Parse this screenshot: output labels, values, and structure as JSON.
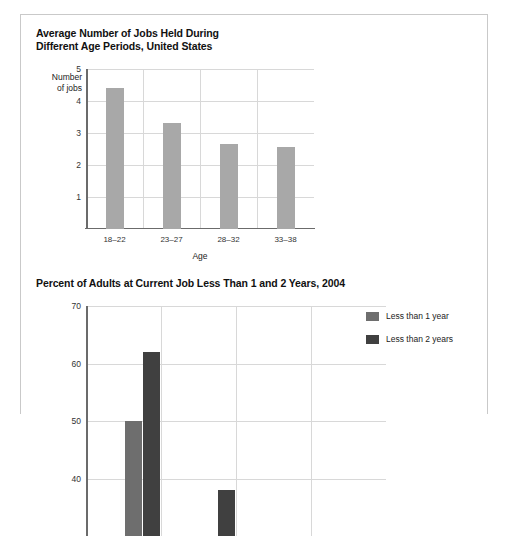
{
  "figure1": {
    "title": "Average Number of Jobs Held During\nDifferent Age Periods, United States",
    "title_line1": "Average Number of Jobs Held During",
    "title_line2": "Different Age Periods, United States",
    "ylabel_line1": "Number",
    "ylabel_line2": "of jobs",
    "xlabel": "Age"
  },
  "figure2": {
    "title": "Percent of Adults at Current Job Less Than 1 and 2 Years, 2004",
    "legend": [
      {
        "label": "Less than 1 year",
        "color": "#6e6e6e"
      },
      {
        "label": "Less than 2 years",
        "color": "#404040"
      }
    ]
  },
  "colors": {
    "bar_gray": "#a8a8a8",
    "series1": "#6e6e6e",
    "series2": "#404040",
    "grid": "#d8d8d8",
    "axis": "#6b6b6b"
  },
  "chart_data": [
    {
      "type": "bar",
      "title": "Average Number of Jobs Held During Different Age Periods, United States",
      "xlabel": "Age",
      "ylabel": "Number of jobs",
      "categories": [
        "18–22",
        "23–27",
        "28–32",
        "33–38"
      ],
      "values": [
        4.4,
        3.3,
        2.65,
        2.55
      ],
      "yticks": [
        1,
        2,
        3,
        4,
        5
      ],
      "ytick_labels": [
        "1",
        "2",
        "3",
        "4",
        "5"
      ],
      "ylim": [
        0,
        5
      ],
      "grid": true,
      "legend": false
    },
    {
      "type": "bar",
      "title": "Percent of Adults at Current Job Less Than 1 and 2 Years, 2004",
      "xlabel": "",
      "ylabel": "",
      "categories": [
        "group-1",
        "group-2"
      ],
      "series": [
        {
          "name": "Less than 1 year",
          "values": [
            50,
            30
          ]
        },
        {
          "name": "Less than 2 years",
          "values": [
            62,
            38
          ]
        }
      ],
      "yticks": [
        40,
        50,
        60,
        70
      ],
      "ytick_labels": [
        "40",
        "50",
        "60",
        "70"
      ],
      "ylim": [
        30,
        70
      ],
      "grid": true,
      "legend": true,
      "legend_position": "right",
      "note": "chart is cropped at the bottom edge of the screenshot"
    }
  ]
}
